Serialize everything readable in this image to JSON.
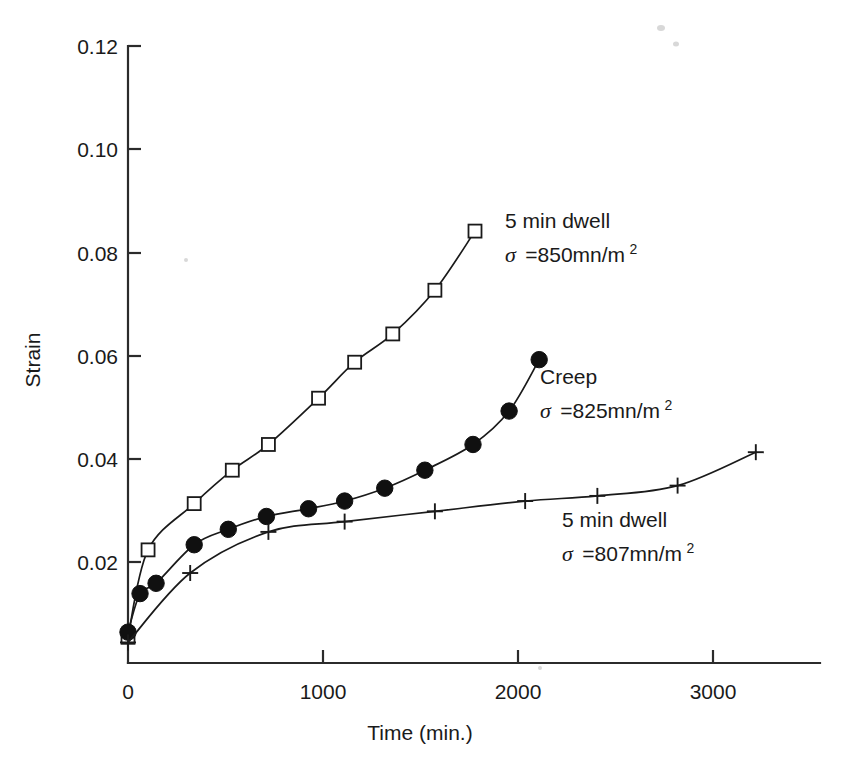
{
  "chart_data": {
    "type": "line",
    "title": "",
    "xlabel": "Time (min.)",
    "ylabel": "Strain",
    "xlim": [
      0,
      3450
    ],
    "ylim": [
      0,
      0.12
    ],
    "grid": false,
    "legend_position": "inline-annotations",
    "x_ticks": [
      0,
      1000,
      2000,
      3000
    ],
    "x_tick_labels": [
      "0",
      "1000",
      "2000",
      "3000"
    ],
    "y_ticks": [
      0.02,
      0.04,
      0.06,
      0.08,
      0.1,
      0.12
    ],
    "y_tick_labels": [
      "0.02",
      "0.04",
      "0.06",
      "0.08",
      "0.10",
      "0.12"
    ],
    "series": [
      {
        "name": "5 min dwell, sigma = 850 mn/m2",
        "marker": "open-square",
        "label_line1": "5 min dwell",
        "label_line2_sigma": "σ",
        "label_line2_eq": "=850mn/m",
        "label_line2_sup": "2",
        "label_x": 505,
        "label_y": 228,
        "x": [
          0,
          100,
          330,
          520,
          700,
          950,
          1130,
          1320,
          1530,
          1730
        ],
        "y": [
          0.005,
          0.022,
          0.031,
          0.0375,
          0.0425,
          0.0515,
          0.0585,
          0.064,
          0.0725,
          0.084
        ]
      },
      {
        "name": "Creep, sigma = 825 mn/m2",
        "marker": "filled-circle",
        "label_line1": "Creep",
        "label_line2_sigma": "σ",
        "label_line2_eq": "=825mn/m",
        "label_line2_sup": "2",
        "label_x": 540,
        "label_y": 384,
        "x": [
          0,
          60,
          140,
          330,
          500,
          690,
          900,
          1080,
          1280,
          1480,
          1720,
          1900,
          2050
        ],
        "y": [
          0.006,
          0.0135,
          0.0155,
          0.023,
          0.026,
          0.0285,
          0.03,
          0.0315,
          0.034,
          0.0375,
          0.0425,
          0.049,
          0.059
        ]
      },
      {
        "name": "5 min dwell, sigma = 807 mn/m2",
        "marker": "plus",
        "label_line1": "5 min dwell",
        "label_line2_sigma": "σ",
        "label_line2_eq": "=807mn/m",
        "label_line2_sup": "2",
        "label_x": 562,
        "label_y": 527,
        "x": [
          0,
          310,
          700,
          1080,
          1530,
          1980,
          2340,
          2740,
          3130
        ],
        "y": [
          0.004,
          0.0175,
          0.0255,
          0.0275,
          0.0295,
          0.0315,
          0.0325,
          0.0345,
          0.041
        ]
      }
    ]
  },
  "axes": {
    "y_title": "Strain",
    "x_title": "Time (min.)",
    "y_tick_labels": [
      "0.12",
      "0.10",
      "0.08",
      "0.06",
      "0.04",
      "0.02"
    ],
    "x_tick_labels": [
      "0",
      "1000",
      "2000",
      "3000"
    ]
  },
  "annotations": {
    "series_1": {
      "line1": "5 min dwell",
      "sigma": "σ",
      "value": "=850mn/m",
      "exponent": "2"
    },
    "series_2": {
      "line1": "Creep",
      "sigma": "σ",
      "value": "=825mn/m",
      "exponent": "2"
    },
    "series_3": {
      "line1": "5 min dwell",
      "sigma": "σ",
      "value": "=807mn/m",
      "exponent": "2"
    }
  },
  "colors": {
    "ink": "#1a1a1a",
    "axis": "#2b2b2b",
    "background": "#ffffff",
    "marker_fill_open": "#ffffff",
    "marker_fill_solid": "#101010"
  }
}
